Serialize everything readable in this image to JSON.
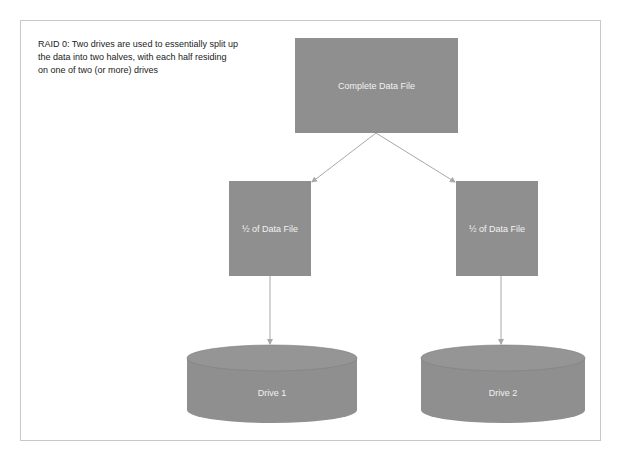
{
  "caption": "RAID 0: Two drives are used to essentially split up the data into two halves, with each half residing on one of two (or more) drives",
  "nodes": {
    "complete": {
      "label": "Complete Data File"
    },
    "half_left": {
      "label": "½ of Data File"
    },
    "half_right": {
      "label": "½ of Data File"
    },
    "drive_1": {
      "label": "Drive 1"
    },
    "drive_2": {
      "label": "Drive 2"
    }
  },
  "edges": [
    {
      "from": "complete",
      "to": "half_left"
    },
    {
      "from": "complete",
      "to": "half_right"
    },
    {
      "from": "half_left",
      "to": "drive_1"
    },
    {
      "from": "half_right",
      "to": "drive_2"
    }
  ],
  "colors": {
    "shape_fill": "#8f8f8f",
    "cylinder_top": "#9a9a9a",
    "arrow": "#a8a8a8",
    "frame_border": "#c8c8c8",
    "label_text": "#f2f2f2"
  }
}
